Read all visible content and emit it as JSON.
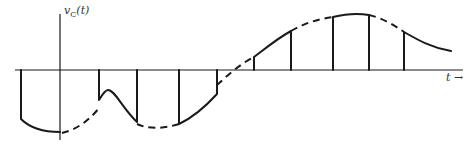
{
  "diagram": {
    "type": "sample-and-hold waveform",
    "y_axis_label": {
      "var": "v",
      "subscript": "C",
      "arg": "(t)"
    },
    "x_axis_label": "t →",
    "colors": {
      "stroke": "#1a1a1a",
      "label": "#333333"
    },
    "legend_note": "solid = held capacitor voltage; dashed = underlying input signal"
  }
}
